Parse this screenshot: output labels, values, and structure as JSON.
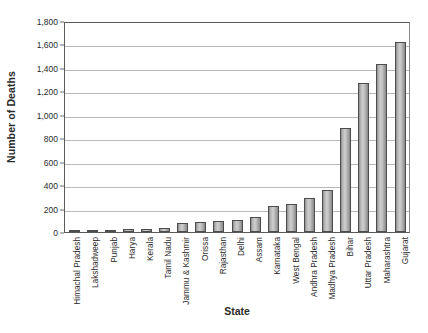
{
  "chart_data": {
    "type": "bar",
    "title": "",
    "xlabel": "State",
    "ylabel": "Number of Deaths",
    "ylim": [
      0,
      1800
    ],
    "ytick_step": 200,
    "yticks": [
      "0",
      "200",
      "400",
      "600",
      "800",
      "1,000",
      "1,200",
      "1,400",
      "1,600",
      "1,800"
    ],
    "ytick_values": [
      0,
      200,
      400,
      600,
      800,
      1000,
      1200,
      1400,
      1600,
      1800
    ],
    "grid": true,
    "legend": null,
    "bar_color": "#b4b4b4",
    "bar_edge_color": "#4d4d4d",
    "categories": [
      "Himachal Pradesh",
      "Lakshadweep",
      "Punjab",
      "Harya",
      "Kerala",
      "Tamil Nadu",
      "Jammu & Kashmir",
      "Orissa",
      "Rajasthan",
      "Delhi",
      "Assam",
      "Karnataka",
      "West Bengal",
      "Andhra Pradesh",
      "Madhya Pradesh",
      "Bihar",
      "Uttar Pradesh",
      "Maharashtra",
      "Gujarat"
    ],
    "values": [
      5,
      10,
      15,
      22,
      28,
      33,
      75,
      82,
      95,
      105,
      125,
      225,
      235,
      290,
      360,
      890,
      1270,
      1430,
      1620
    ]
  }
}
